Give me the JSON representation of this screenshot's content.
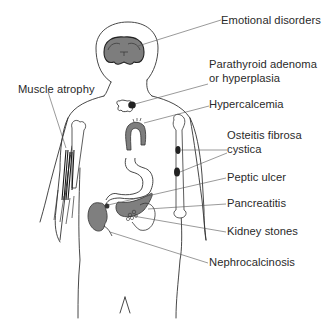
{
  "diagram": {
    "colors": {
      "outline": "#333333",
      "organ_fill": "#8a8a8a",
      "dark_lesion": "#2b2b2b",
      "leader_line": "#555555",
      "text": "#2a2a2a",
      "background": "#ffffff"
    },
    "labels": [
      {
        "id": "emotional",
        "text": "Emotional disorders",
        "points_to": "brain"
      },
      {
        "id": "parathyroid",
        "line1": "Parathyroid adenoma",
        "line2": "or hyperplasia",
        "points_to": "parathyroid gland"
      },
      {
        "id": "hypercalcemia",
        "text": "Hypercalcemia",
        "points_to": "aortic arch"
      },
      {
        "id": "osteitis",
        "line1": "Osteitis fibrosa",
        "line2": "cystica",
        "points_to": "humerus bone lesions"
      },
      {
        "id": "peptic",
        "text": "Peptic ulcer",
        "points_to": "stomach"
      },
      {
        "id": "pancreatitis",
        "text": "Pancreatitis",
        "points_to": "pancreas"
      },
      {
        "id": "kidney_stones",
        "text": "Kidney stones",
        "points_to": "kidney"
      },
      {
        "id": "nephrocalcinosis",
        "text": "Nephrocalcinosis",
        "points_to": "kidney"
      },
      {
        "id": "muscle",
        "text": "Muscle atrophy",
        "points_to": "arm muscle"
      }
    ]
  }
}
